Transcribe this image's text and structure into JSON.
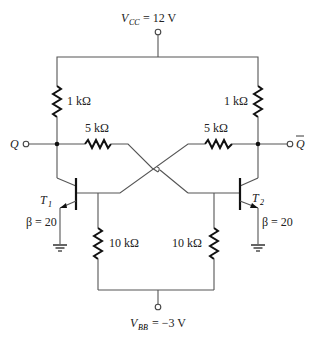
{
  "diagram": {
    "type": "transistor bistable multivibrator (flip-flop)",
    "supplies": {
      "vcc": {
        "symbol": "V",
        "subscript": "CC",
        "value": "= 12 V"
      },
      "vbb": {
        "symbol": "V",
        "subscript": "BB",
        "value": "= −3 V"
      }
    },
    "outputs": {
      "q": "Q",
      "q_bar": "Q"
    },
    "resistors": {
      "rc1": "1 kΩ",
      "rc2": "1 kΩ",
      "r_cross_left": "5 kΩ",
      "r_cross_right": "5 kΩ",
      "rb1": "10 kΩ",
      "rb2": "10 kΩ"
    },
    "transistors": [
      {
        "id": "T1",
        "symbol": "T",
        "subscript": "1",
        "beta": "β = 20"
      },
      {
        "id": "T2",
        "symbol": "T",
        "subscript": "2",
        "beta": "β = 20"
      }
    ],
    "colors": {
      "wire": "#555555",
      "component": "#111111",
      "text": "#222222"
    }
  }
}
